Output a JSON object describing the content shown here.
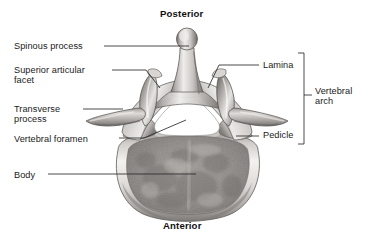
{
  "figure": {
    "type": "anatomical-illustration",
    "background_color": "#ffffff",
    "text_color": "#1b1b1b",
    "leader_line_color": "#2b2b2b"
  },
  "orientation": {
    "top_label": "Posterior",
    "bottom_label": "Anterior"
  },
  "labels": {
    "spinous_process": "Spinous process",
    "superior_articular_facet": "Superior articular\nfacet",
    "transverse_process": "Transverse\nprocess",
    "vertebral_foramen": "Vertebral foramen",
    "body": "Body",
    "lamina": "Lamina",
    "pedicle": "Pedicle",
    "vertebral_arch": "Vertebral\narch"
  },
  "bracket": {
    "label": "Vertebral arch",
    "groups": [
      "Lamina",
      "Pedicle"
    ]
  },
  "structures": [
    {
      "name": "spinous-process",
      "side": "posterior-midline"
    },
    {
      "name": "superior-articular-facet",
      "side": "bilateral"
    },
    {
      "name": "transverse-process",
      "side": "bilateral"
    },
    {
      "name": "vertebral-foramen",
      "side": "central"
    },
    {
      "name": "pedicle",
      "side": "bilateral"
    },
    {
      "name": "lamina",
      "side": "bilateral"
    },
    {
      "name": "vertebral-body",
      "side": "anterior"
    }
  ],
  "colors": {
    "bone_light": "#f2f0ee",
    "bone_mid": "#b9b6b3",
    "bone_dark": "#6f6d6b",
    "bone_shadow": "#4a4846",
    "trabecular": "#9a9794",
    "foramen": "#ffffff"
  }
}
